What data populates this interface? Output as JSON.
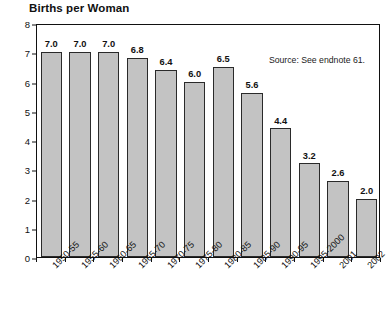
{
  "chart_data": {
    "type": "bar",
    "title": "Births per Woman",
    "xlabel": "",
    "ylabel": "",
    "ylim": [
      0,
      8
    ],
    "yticks": [
      0,
      1,
      2,
      3,
      4,
      5,
      6,
      7,
      8
    ],
    "ytick_labels": [
      "0",
      "1",
      "2",
      "3",
      "4",
      "5",
      "6",
      "7",
      "8"
    ],
    "grid": false,
    "legend": null,
    "annotations": [
      "Source: See endnote 61."
    ],
    "source_note": "Source: See endnote 61.",
    "bar_color": "#c3c3c3",
    "bar_edge_color": "#2a2a2a",
    "axis_color": "#111111",
    "categories": [
      "1950-55",
      "1955-60",
      "1960-65",
      "1965-70",
      "1970-75",
      "1975-80",
      "1980-85",
      "1985-90",
      "1990-95",
      "1995-2000",
      "2001",
      "2002"
    ],
    "values": [
      7.0,
      7.0,
      7.0,
      6.8,
      6.4,
      6.0,
      6.5,
      5.6,
      4.4,
      3.2,
      2.6,
      2.0
    ],
    "value_labels": [
      "7.0",
      "7.0",
      "7.0",
      "6.8",
      "6.4",
      "6.0",
      "6.5",
      "5.6",
      "4.4",
      "3.2",
      "2.6",
      "2.0"
    ]
  }
}
